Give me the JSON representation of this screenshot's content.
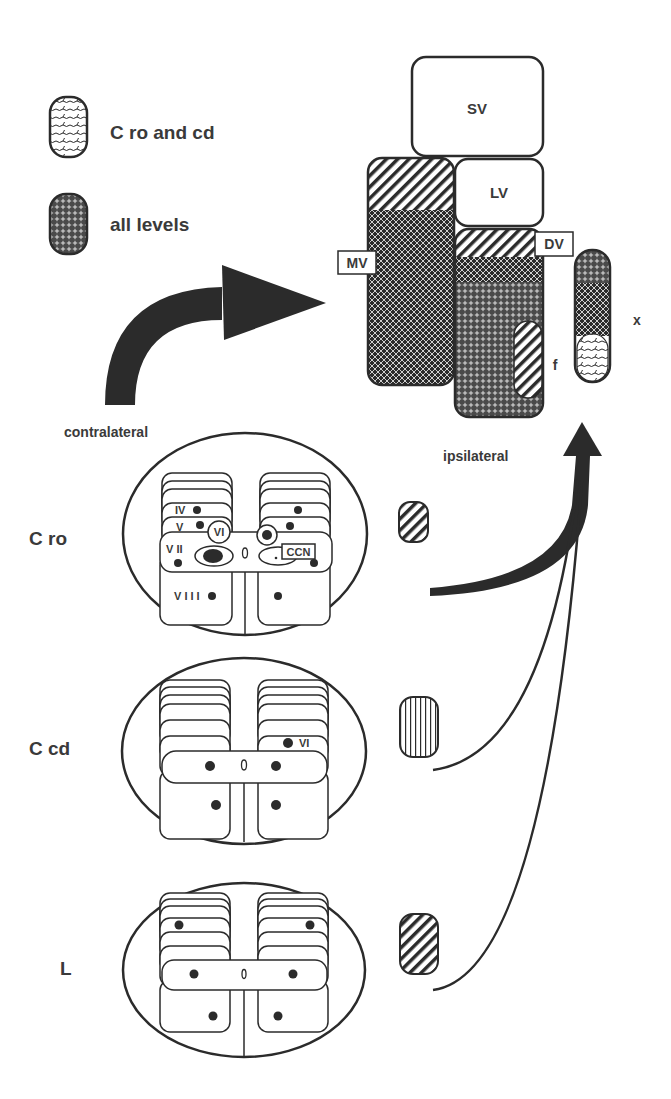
{
  "legend": {
    "items": [
      {
        "label": "C ro and cd",
        "pattern": "wavy"
      },
      {
        "label": "all levels",
        "pattern": "dotted-cross"
      }
    ]
  },
  "vestibular_nuclei": {
    "sv": "SV",
    "lv": "LV",
    "mv": "MV",
    "dv": "DV",
    "f": "f",
    "x": "x"
  },
  "arrows": {
    "contralateral": "contralateral",
    "ipsilateral": "ipsilateral"
  },
  "levels": [
    {
      "label": "C ro",
      "laminae": {
        "iv": "IV",
        "v": "V",
        "vi": "VI",
        "vii": "V II",
        "viii": "V I I I",
        "ccn": "CCN"
      },
      "marker_pattern": "diagonal-stripes"
    },
    {
      "label": "C cd",
      "laminae": {
        "vi": "VI"
      },
      "marker_pattern": "vertical-stripes"
    },
    {
      "label": "L",
      "laminae": {},
      "marker_pattern": "diagonal-stripes"
    }
  ],
  "colors": {
    "ink": "#2b2b2b",
    "background": "#ffffff"
  }
}
